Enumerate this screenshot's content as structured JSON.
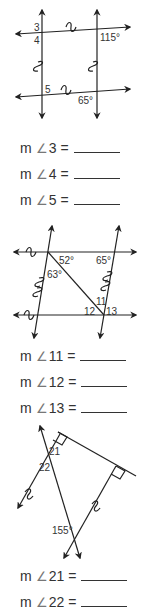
{
  "worksheet": {
    "figure1": {
      "angle_labels": {
        "a3": "3",
        "a4": "4",
        "a5": "5",
        "given_top_right": "115°",
        "given_bottom": "65°"
      }
    },
    "questions_set1": [
      {
        "prefix": "m",
        "angle_symbol": "∠",
        "number": "3",
        "equals": "="
      },
      {
        "prefix": "m",
        "angle_symbol": "∠",
        "number": "4",
        "equals": "="
      },
      {
        "prefix": "m",
        "angle_symbol": "∠",
        "number": "5",
        "equals": "="
      }
    ],
    "figure2": {
      "angle_labels": {
        "given_52": "52°",
        "given_65": "65°",
        "given_63": "63°",
        "a11": "11",
        "a12": "12",
        "a13": "13"
      }
    },
    "questions_set2": [
      {
        "prefix": "m",
        "angle_symbol": "∠",
        "number": "11",
        "equals": "="
      },
      {
        "prefix": "m",
        "angle_symbol": "∠",
        "number": "12",
        "equals": "="
      },
      {
        "prefix": "m",
        "angle_symbol": "∠",
        "number": "13",
        "equals": "="
      }
    ],
    "figure3": {
      "angle_labels": {
        "a21": "21",
        "a22": "22",
        "given_155": "155°"
      }
    },
    "questions_set3": [
      {
        "prefix": "m",
        "angle_symbol": "∠",
        "number": "21",
        "equals": "="
      },
      {
        "prefix": "m",
        "angle_symbol": "∠",
        "number": "22",
        "equals": "="
      }
    ]
  }
}
